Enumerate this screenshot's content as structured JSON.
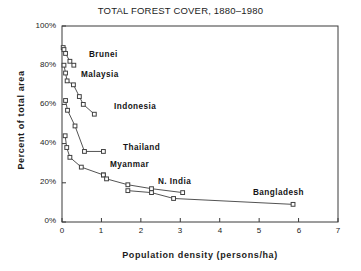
{
  "chart_data": {
    "type": "line",
    "title": "TOTAL FOREST COVER, 1880–1980",
    "xlabel": "Population density  (persons/ha)",
    "ylabel": "Percent  of  total  area",
    "xlim": [
      0,
      7
    ],
    "ylim": [
      0,
      100
    ],
    "xticks": [
      0,
      1,
      2,
      3,
      4,
      5,
      6,
      7
    ],
    "xtick_labels": [
      "0",
      "1",
      "2",
      "3",
      "4",
      "5",
      "6",
      "7"
    ],
    "yticks": [
      0,
      20,
      40,
      60,
      80,
      100
    ],
    "ytick_labels": [
      "0%",
      "20%",
      "40%",
      "60%",
      "80%",
      "100%"
    ],
    "grid": false,
    "legend_position": "inline-annotations",
    "marker": "open-square",
    "line_color": "#404040",
    "series": [
      {
        "name": "Brunei",
        "label_x": 0.72,
        "label_y": 84,
        "points": [
          {
            "x": 0.03,
            "y": 89
          },
          {
            "x": 0.05,
            "y": 88
          },
          {
            "x": 0.09,
            "y": 86
          },
          {
            "x": 0.2,
            "y": 82
          },
          {
            "x": 0.3,
            "y": 80
          }
        ]
      },
      {
        "name": "Malaysia",
        "label_x": 0.62,
        "label_y": 73,
        "points": [
          {
            "x": 0.05,
            "y": 80
          },
          {
            "x": 0.09,
            "y": 76
          },
          {
            "x": 0.13,
            "y": 72
          },
          {
            "x": 0.29,
            "y": 70
          },
          {
            "x": 0.44,
            "y": 64
          },
          {
            "x": 0.54,
            "y": 60
          },
          {
            "x": 0.82,
            "y": 55
          }
        ]
      },
      {
        "name": "Indonesia",
        "label_x": 1.22,
        "label_y": 55,
        "points": [
          {
            "x": 0.09,
            "y": 62
          },
          {
            "x": 0.14,
            "y": 57
          },
          {
            "x": 0.33,
            "y": 49
          },
          {
            "x": 0.57,
            "y": 36
          },
          {
            "x": 1.05,
            "y": 36
          }
        ]
      },
      {
        "name": "Thailand",
        "label_x": 1.43,
        "label_y": 36,
        "points": [
          {
            "x": 0.08,
            "y": 44
          },
          {
            "x": 0.12,
            "y": 38
          },
          {
            "x": 0.2,
            "y": 33
          },
          {
            "x": 0.49,
            "y": 28
          },
          {
            "x": 1.05,
            "y": 24
          }
        ]
      },
      {
        "name": "Myanmar",
        "label_x": 1.26,
        "label_y": 28,
        "points": [
          {
            "x": 1.05,
            "y": 24
          },
          {
            "x": 1.13,
            "y": 22
          },
          {
            "x": 1.67,
            "y": 19
          },
          {
            "x": 2.27,
            "y": 17
          },
          {
            "x": 3.06,
            "y": 15
          }
        ]
      },
      {
        "name": "N. India",
        "label_x": 2.42,
        "label_y": 20,
        "points": [
          {
            "x": 1.67,
            "y": 16
          },
          {
            "x": 2.27,
            "y": 15
          },
          {
            "x": 2.83,
            "y": 12
          },
          {
            "x": 5.86,
            "y": 9
          }
        ]
      },
      {
        "name": "Bangladesh",
        "label_x": 4.7,
        "label_y": 14,
        "points": []
      }
    ]
  }
}
